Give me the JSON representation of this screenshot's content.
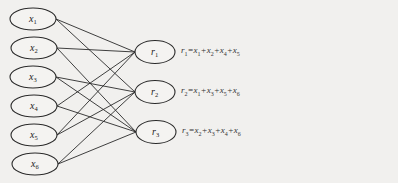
{
  "diagram": {
    "inputs": [
      {
        "id": "x1",
        "base": "x",
        "sub": "1",
        "cx": 33,
        "cy": 19
      },
      {
        "id": "x2",
        "base": "x",
        "sub": "2",
        "cx": 34,
        "cy": 48
      },
      {
        "id": "x3",
        "base": "x",
        "sub": "3",
        "cx": 33,
        "cy": 77
      },
      {
        "id": "x4",
        "base": "x",
        "sub": "4",
        "cx": 34,
        "cy": 106
      },
      {
        "id": "x5",
        "base": "x",
        "sub": "5",
        "cx": 34,
        "cy": 135
      },
      {
        "id": "x6",
        "base": "x",
        "sub": "6",
        "cx": 35,
        "cy": 164
      }
    ],
    "outputs": [
      {
        "id": "r1",
        "base": "r",
        "sub": "1",
        "cx": 155,
        "cy": 52,
        "equation": {
          "lhs": "r1",
          "terms": [
            "x1",
            "x2",
            "x4",
            "x5"
          ]
        }
      },
      {
        "id": "r2",
        "base": "r",
        "sub": "2",
        "cx": 155,
        "cy": 92,
        "equation": {
          "lhs": "r2",
          "terms": [
            "x1",
            "x3",
            "x5",
            "x6"
          ]
        }
      },
      {
        "id": "r3",
        "base": "r",
        "sub": "3",
        "cx": 156,
        "cy": 132,
        "equation": {
          "lhs": "r3",
          "terms": [
            "x2",
            "x3",
            "x4",
            "x6"
          ]
        }
      }
    ],
    "equations_text": [
      "r1=x1+x2+x4+x5",
      "r2=x1+x3+x5+x6",
      "r3=x2+x3+x4+x6"
    ],
    "style": {
      "stroke": "#2a2a2a",
      "background": "#f1f0ee"
    }
  }
}
